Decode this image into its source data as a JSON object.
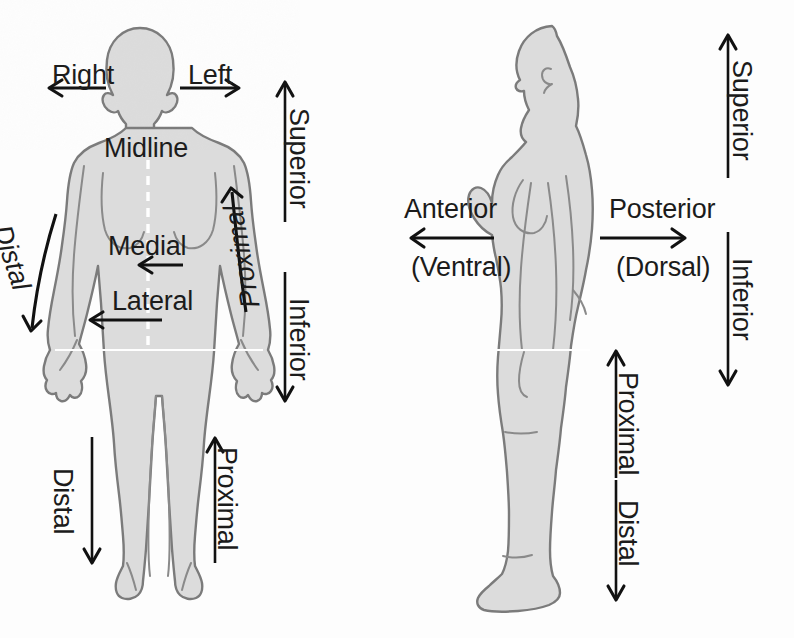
{
  "diagram": {
    "background_color": "#fdfdfd",
    "body_fill_color": "#dcdcdc",
    "body_outline_color": "#7b7b7b",
    "arrow_color": "#111111",
    "midline_color": "#ffffff"
  },
  "anterior_view": {
    "view_name": "anterior-view",
    "labels": {
      "right": "Right",
      "left": "Left",
      "midline": "Midline",
      "medial": "Medial",
      "lateral": "Lateral",
      "distal_arm": "Distal",
      "proximal_arm": "Proximal",
      "superior": "Superior",
      "inferior": "Inferior",
      "distal_leg": "Distal",
      "proximal_leg": "Proximal"
    }
  },
  "lateral_view": {
    "view_name": "lateral-view",
    "labels": {
      "anterior": "Anterior",
      "anterior_alt": "(Ventral)",
      "posterior": "Posterior",
      "posterior_alt": "(Dorsal)",
      "superior": "Superior",
      "inferior": "Inferior",
      "proximal_leg": "Proximal",
      "distal_leg": "Distal"
    }
  },
  "arrows": [
    {
      "name": "right-arrow",
      "direction": "left",
      "view": "anterior"
    },
    {
      "name": "left-arrow",
      "direction": "right",
      "view": "anterior"
    },
    {
      "name": "medial-arrow",
      "direction": "left",
      "view": "anterior"
    },
    {
      "name": "lateral-arrow",
      "direction": "left",
      "view": "anterior"
    },
    {
      "name": "distal-arm-arrow",
      "direction": "down-curved",
      "view": "anterior"
    },
    {
      "name": "proximal-arm-arrow",
      "direction": "up-curved",
      "view": "anterior"
    },
    {
      "name": "superior-arrow",
      "direction": "up",
      "view": "anterior"
    },
    {
      "name": "inferior-arrow",
      "direction": "down",
      "view": "anterior"
    },
    {
      "name": "distal-leg-arrow",
      "direction": "down",
      "view": "anterior"
    },
    {
      "name": "proximal-leg-arrow",
      "direction": "up",
      "view": "anterior"
    },
    {
      "name": "anterior-arrow",
      "direction": "left",
      "view": "lateral"
    },
    {
      "name": "posterior-arrow",
      "direction": "right",
      "view": "lateral"
    },
    {
      "name": "superior-arrow",
      "direction": "up",
      "view": "lateral"
    },
    {
      "name": "inferior-arrow",
      "direction": "down",
      "view": "lateral"
    },
    {
      "name": "proximal-leg-arrow",
      "direction": "up",
      "view": "lateral"
    },
    {
      "name": "distal-leg-arrow",
      "direction": "down",
      "view": "lateral"
    }
  ]
}
